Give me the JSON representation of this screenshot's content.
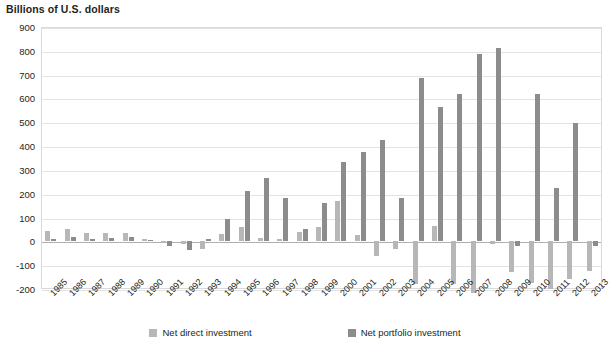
{
  "chart_data": {
    "type": "bar",
    "title": "Billions of U.S. dollars",
    "xlabel": "",
    "ylabel": "Billions of U.S. dollars",
    "ylim": [
      -200,
      900
    ],
    "ytick_step": 100,
    "yticks": [
      "900",
      "800",
      "700",
      "600",
      "500",
      "400",
      "300",
      "200",
      "100",
      "0",
      "-100",
      "-200"
    ],
    "grid": true,
    "legend_position": "bottom",
    "categories": [
      "1985",
      "1986",
      "1987",
      "1988",
      "1989",
      "1990",
      "1991",
      "1992",
      "1993",
      "1994",
      "1995",
      "1996",
      "1997",
      "1998",
      "1999",
      "2000",
      "2001",
      "2002",
      "2003",
      "2004",
      "2005",
      "2006",
      "2007",
      "2008",
      "2009",
      "2010",
      "2011",
      "2012",
      "2013"
    ],
    "series": [
      {
        "name": "Net direct investment",
        "color": "#b7b7b7",
        "values": [
          45,
          50,
          35,
          35,
          35,
          10,
          -5,
          -10,
          -30,
          30,
          60,
          15,
          10,
          40,
          60,
          170,
          25,
          -60,
          -30,
          -180,
          65,
          -180,
          -215,
          -10,
          -130,
          -175,
          -200,
          -160,
          -125
        ]
      },
      {
        "name": "Net portfolio investment",
        "color": "#8c8c8c",
        "values": [
          10,
          20,
          10,
          15,
          20,
          5,
          -20,
          -35,
          10,
          95,
          210,
          265,
          180,
          50,
          160,
          335,
          375,
          425,
          180,
          685,
          565,
          620,
          785,
          810,
          -20,
          620,
          225,
          495,
          -20
        ]
      }
    ]
  },
  "legend": {
    "items": [
      {
        "label": "Net direct investment",
        "swatch": "direct"
      },
      {
        "label": "Net portfolio investment",
        "swatch": "portfolio"
      }
    ]
  }
}
